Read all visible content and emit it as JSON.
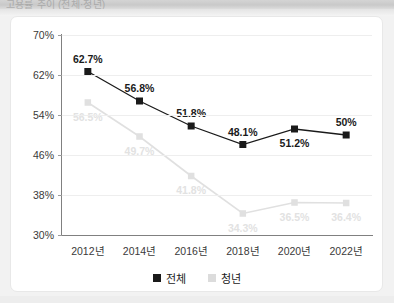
{
  "window": {
    "header_ghost_text": "고용률 추이 (전체·청년)"
  },
  "chart_data": {
    "type": "line",
    "title": "",
    "xlabel": "",
    "ylabel": "",
    "categories": [
      "2012년",
      "2014년",
      "2016년",
      "2018년",
      "2020년",
      "2022년"
    ],
    "series": [
      {
        "name": "전체",
        "color": "#1a1a1a",
        "marker": "square",
        "values": [
          62.7,
          56.8,
          51.8,
          48.1,
          51.2,
          50
        ],
        "labels": [
          "62.7%",
          "56.8%",
          "51.8%",
          "48.1%",
          "51.2%",
          "50%"
        ]
      },
      {
        "name": "청년",
        "color": "#e0e0e0",
        "marker": "square",
        "values": [
          56.5,
          49.7,
          41.8,
          34.3,
          36.5,
          36.4
        ],
        "labels": [
          "56.5%",
          "49.7%",
          "41.8%",
          "34.3%",
          "36.5%",
          "36.4%"
        ]
      }
    ],
    "ylim": [
      30,
      70
    ],
    "ytick_values": [
      70,
      62,
      54,
      46,
      38,
      30
    ],
    "ytick_labels": [
      "70%",
      "62%",
      "54%",
      "46%",
      "38%",
      "30%"
    ],
    "grid": true,
    "legend_position": "bottom"
  },
  "legend": {
    "items": [
      {
        "label": "전체",
        "color": "#1a1a1a"
      },
      {
        "label": "청년",
        "color": "#dcdcdc"
      }
    ]
  }
}
